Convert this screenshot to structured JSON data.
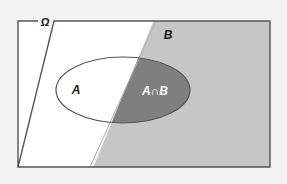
{
  "figure": {
    "name": "venn-diagram-intersection",
    "type": "set-venn-diagram",
    "background_color": "#f2f2f2",
    "universe_fill": "#ffffff",
    "set_b_fill": "#c6c6c6",
    "intersection_fill": "#7f7f7f",
    "border_color": "#555555",
    "ellipse_stroke": "#555555"
  },
  "labels": {
    "universe": "Ω",
    "set_a": "A",
    "set_b": "B",
    "intersection": "A∩B"
  },
  "label_colors": {
    "universe": "#1a1a1a",
    "set_a": "#1a1a1a",
    "set_b": "#1a1a1a",
    "intersection": "#ffffff"
  },
  "geometry": {
    "frame": {
      "x": 18,
      "y": 21,
      "width": 252,
      "height": 146
    },
    "diagonal": {
      "x_top": 156,
      "x_bottom": 90
    },
    "ellipse": {
      "cx": 123,
      "cy": 90,
      "rx": 67,
      "ry": 33
    },
    "label_positions": {
      "universe": {
        "x": 45,
        "y": 24
      },
      "set_a": {
        "x": 76,
        "y": 93
      },
      "set_b": {
        "x": 168,
        "y": 38
      },
      "intersection": {
        "x": 155,
        "y": 93
      }
    }
  }
}
